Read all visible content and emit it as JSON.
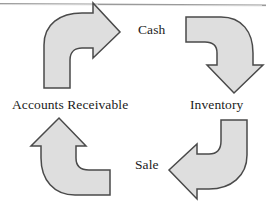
{
  "diagram": {
    "rule_present": true,
    "fill_color": "#dedede",
    "stroke_color": "#4a4a4a",
    "text_color": "#1b1b1b",
    "background_color": "#ffffff",
    "labels": {
      "cash": "Cash",
      "inventory": "Inventory",
      "sale": "Sale",
      "accounts_receivable": "Accounts Receivable"
    },
    "arrows": [
      {
        "name": "arrow-accounts-receivable-to-cash",
        "from": "Accounts Receivable",
        "to": "Cash",
        "position": "top-left",
        "direction": "up-then-right",
        "points_toward": "right"
      },
      {
        "name": "arrow-cash-to-inventory",
        "from": "Cash",
        "to": "Inventory",
        "position": "top-right",
        "direction": "right-then-down",
        "points_toward": "down"
      },
      {
        "name": "arrow-inventory-to-sale",
        "from": "Inventory",
        "to": "Sale",
        "position": "bottom-right",
        "direction": "down-then-left",
        "points_toward": "left"
      },
      {
        "name": "arrow-sale-to-accounts-receivable",
        "from": "Sale",
        "to": "Accounts Receivable",
        "position": "bottom-left",
        "direction": "left-then-up",
        "points_toward": "up"
      }
    ]
  }
}
